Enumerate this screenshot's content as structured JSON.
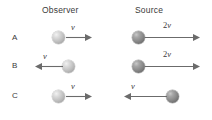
{
  "figure": {
    "background_color": "#ffffff",
    "line_color": "#6b6b6b",
    "text_color": "#3a3a3a",
    "observer_ball_color": "#c2c2c2",
    "source_ball_color": "#8a8a8a"
  },
  "headers": {
    "observer": "Observer",
    "source": "Source"
  },
  "rows": [
    {
      "label": "A",
      "observer": {
        "speed_coefficient": "",
        "speed_symbol": "v",
        "direction": "right"
      },
      "source": {
        "speed_coefficient": "2",
        "speed_symbol": "v",
        "direction": "right"
      }
    },
    {
      "label": "B",
      "observer": {
        "speed_coefficient": "",
        "speed_symbol": "v",
        "direction": "left"
      },
      "source": {
        "speed_coefficient": "2",
        "speed_symbol": "v",
        "direction": "right"
      }
    },
    {
      "label": "C",
      "observer": {
        "speed_coefficient": "",
        "speed_symbol": "v",
        "direction": "right"
      },
      "source": {
        "speed_coefficient": "",
        "speed_symbol": "v",
        "direction": "left"
      }
    }
  ]
}
